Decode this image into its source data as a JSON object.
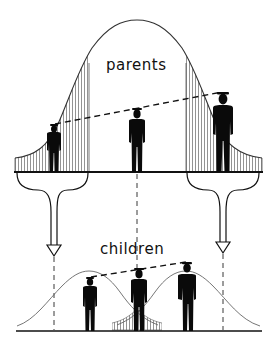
{
  "diagram": {
    "labels": {
      "top": "parents",
      "bottom": "children"
    },
    "colors": {
      "ink": "#111111",
      "curve": "#555555",
      "hatch": "#666666",
      "background": "#ffffff"
    },
    "parents": {
      "distribution": "normal",
      "figures": [
        {
          "id": "short-parent",
          "position": "left tail",
          "x": 54,
          "height_rank": "short"
        },
        {
          "id": "average-parent",
          "position": "center",
          "x": 137,
          "height_rank": "average"
        },
        {
          "id": "tall-parent",
          "position": "right tail",
          "x": 223,
          "height_rank": "tall"
        }
      ],
      "shaded_tails": [
        "left",
        "right"
      ]
    },
    "arrows": [
      {
        "id": "short-parents-arrow",
        "from": "left tail",
        "to": "children of short parents"
      },
      {
        "id": "tall-parents-arrow",
        "from": "right tail",
        "to": "children of tall parents"
      }
    ],
    "children": {
      "distributions": [
        "children of short parents",
        "children of tall parents"
      ],
      "figures": [
        {
          "id": "child-of-short",
          "x": 90,
          "height_rank": "below average"
        },
        {
          "id": "child-average",
          "x": 139,
          "height_rank": "average"
        },
        {
          "id": "child-of-tall",
          "x": 187,
          "height_rank": "above average"
        }
      ],
      "shaded_overlap": "center"
    }
  }
}
